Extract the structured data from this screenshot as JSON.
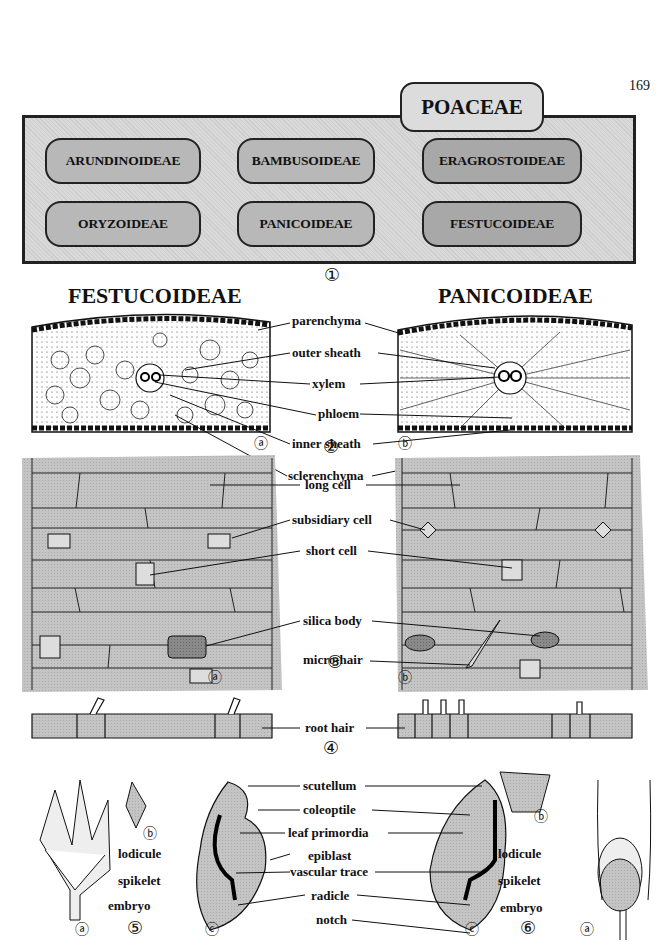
{
  "page_number": "169",
  "family": {
    "title": "POACEAE"
  },
  "subfamilies": [
    {
      "name": "ARUNDINOIDEAE"
    },
    {
      "name": "BAMBUSOIDEAE"
    },
    {
      "name": "ERAGROSTOIDEAE"
    },
    {
      "name": "ORYZOIDEAE"
    },
    {
      "name": "PANICOIDEAE"
    },
    {
      "name": "FESTUCOIDEAE"
    }
  ],
  "figure_numbers": [
    "①",
    "②",
    "③",
    "④",
    "⑤",
    "⑥"
  ],
  "columns": {
    "left": "FESTUCOIDEAE",
    "right": "PANICOIDEAE"
  },
  "panel_letters": {
    "a": "ⓐ",
    "b": "ⓑ",
    "c": "ⓒ"
  },
  "leaf_anatomy_labels": [
    "parenchyma",
    "outer sheath",
    "xylem",
    "phloem",
    "inner sheath",
    "sclerenchyma"
  ],
  "epidermis_labels": [
    "long cell",
    "subsidiary cell",
    "short cell",
    "silica body",
    "micro-hair"
  ],
  "root_label": "root hair",
  "embryo_labels": [
    "scutellum",
    "coleoptile",
    "leaf primordia",
    "epiblast",
    "vascular trace",
    "radicle",
    "notch"
  ],
  "left_flower_labels": {
    "lodicule": "lodicule",
    "spikelet": "spikelet",
    "embryo": "embryo"
  },
  "right_flower_labels": {
    "lodicule": "lodicule",
    "spikelet": "spikelet",
    "embryo": "embryo"
  },
  "colors": {
    "box_fill": "#d9d9d9",
    "pill_fill": "#b8b8b8",
    "stipple": "#bdbdbd",
    "ink": "#111111"
  }
}
